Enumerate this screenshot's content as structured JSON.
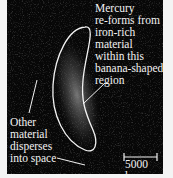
{
  "figure": {
    "label_top": "Mercury\nre-forms from\niron-rich\nmaterial\nwithin this\nbanana-shaped\nregion",
    "label_bottom": "Other\nmaterial\ndisperses\ninto space",
    "scale_bar": "5000 km"
  },
  "colors": {
    "background": "#070707",
    "outline": "#f2f2f2",
    "margin": "#f4f4f4"
  }
}
